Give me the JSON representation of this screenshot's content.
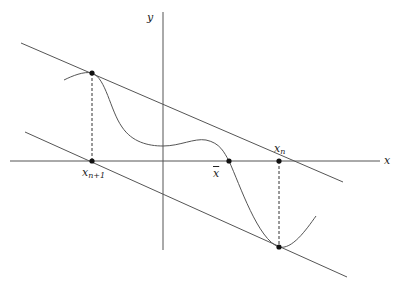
{
  "diagram": {
    "colors": {
      "line": "#555555",
      "curve": "#555555",
      "point": "#111111",
      "text": "#222222",
      "background": "#ffffff"
    },
    "axes": {
      "x_label": "x",
      "y_label": "y"
    },
    "labels": {
      "x_n1_base": "x",
      "x_n1_sub": "n+1",
      "x_bar": "x",
      "x_n_base": "x",
      "x_n_sub": "n"
    },
    "points": [
      {
        "name": "x_n+1 on curve",
        "x": 92,
        "y": 73
      },
      {
        "name": "x_n+1 on axis",
        "x": 92,
        "y": 161
      },
      {
        "name": "x-bar root",
        "x": 229,
        "y": 161
      },
      {
        "name": "x_n on axis",
        "x": 279,
        "y": 161
      },
      {
        "name": "x_n on curve",
        "x": 279,
        "y": 247
      }
    ],
    "tangent_lines": [
      {
        "name": "upper tangent",
        "from": [
          21,
          43
        ],
        "to": [
          343,
          182
        ]
      },
      {
        "name": "lower tangent",
        "from": [
          25,
          132
        ],
        "to": [
          347,
          277
        ]
      }
    ]
  }
}
